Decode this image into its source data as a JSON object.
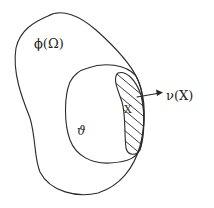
{
  "diagram": {
    "type": "set-inclusion sketch",
    "regions": [
      {
        "id": "outer",
        "label": "ϕ(Ω)"
      },
      {
        "id": "inner",
        "label": "𝒱"
      },
      {
        "id": "hatched",
        "label": "X"
      }
    ],
    "arrow": {
      "from": "X",
      "label": "ν(X)"
    }
  },
  "labels": {
    "outer": "ϕ(Ω)",
    "inner": "ϑ",
    "point": "X",
    "normal": "ν(X)"
  },
  "colors": {
    "ink": "#2a2a2a",
    "background": "#ffffff"
  }
}
